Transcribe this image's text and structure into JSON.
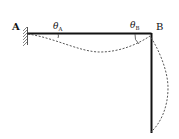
{
  "diagram": {
    "labels": {
      "point_a": "A",
      "point_b": "B",
      "theta_a": "θ",
      "theta_a_sub": "A",
      "theta_b": "θ",
      "theta_b_sub": "B"
    },
    "colors": {
      "member": "#111111",
      "deflected": "#444444",
      "hatch": "#555555"
    }
  }
}
